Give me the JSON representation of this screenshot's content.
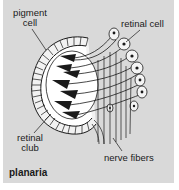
{
  "figure": {
    "title": "planaria",
    "labels": {
      "pigment_cell_line1": "pigment",
      "pigment_cell_line2": "cell",
      "retinal_cell": "retinal cell",
      "retinal_club_line1": "retinal",
      "retinal_club_line2": "club",
      "nerve_fibers": "nerve fibers"
    }
  },
  "colors": {
    "background_panel": "#d9d9d9",
    "page_background": "#ffffff",
    "ink": "#1a1a1a",
    "cell_fill": "#f4f4f4"
  }
}
